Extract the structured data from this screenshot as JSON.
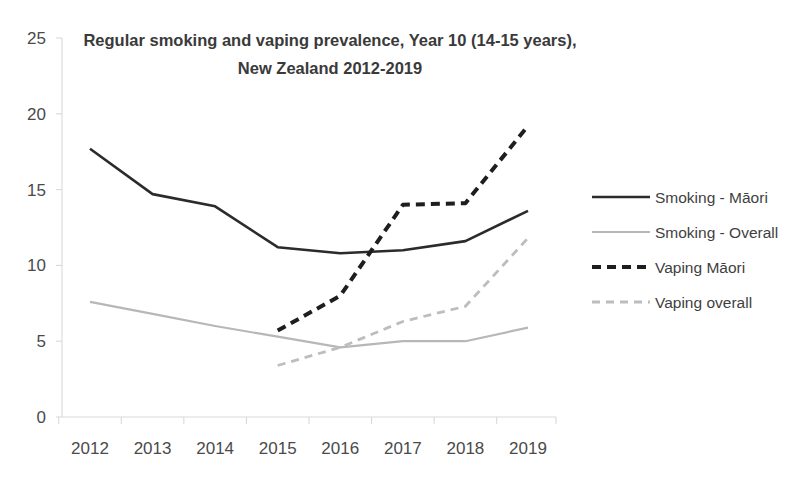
{
  "chart_data": {
    "type": "line",
    "title": "Regular smoking and vaping prevalence, Year 10 (14-15 years), New Zealand 2012-2019",
    "title_line1": "Regular smoking and vaping prevalence, Year 10 (14-15 years),",
    "title_line2": "New Zealand 2012-2019",
    "xlabel": "",
    "ylabel": "",
    "x": [
      2012,
      2013,
      2014,
      2015,
      2016,
      2017,
      2018,
      2019
    ],
    "categories": [
      "2012",
      "2013",
      "2014",
      "2015",
      "2016",
      "2017",
      "2018",
      "2019"
    ],
    "ylim": [
      0,
      25
    ],
    "yticks": [
      0,
      5,
      10,
      15,
      20,
      25
    ],
    "ytick_labels": [
      "0",
      "5",
      "10",
      "15",
      "20",
      "25"
    ],
    "grid": false,
    "legend_position": "right",
    "series": [
      {
        "name": "Smoking - Māori",
        "style": "solid",
        "color": "#2b2b2b",
        "width": 2.6,
        "values": [
          17.7,
          14.7,
          13.9,
          11.2,
          10.8,
          11.0,
          11.6,
          13.6
        ]
      },
      {
        "name": "Smoking - Overall",
        "style": "solid",
        "color": "#b7b7b7",
        "width": 2.2,
        "values": [
          7.6,
          6.8,
          6.0,
          5.3,
          4.6,
          5.0,
          5.0,
          5.9
        ]
      },
      {
        "name": "Vaping Māori",
        "style": "dashed",
        "color": "#1e1e1e",
        "width": 4.0,
        "dash": "9,6",
        "values": [
          null,
          null,
          null,
          5.7,
          8.0,
          14.0,
          14.1,
          19.2
        ]
      },
      {
        "name": "Vaping overall",
        "style": "dashed",
        "color": "#bdbdbd",
        "width": 2.8,
        "dash": "8,6",
        "values": [
          null,
          null,
          null,
          3.4,
          4.6,
          6.3,
          7.3,
          11.8
        ]
      }
    ]
  },
  "legend": {
    "items": [
      {
        "label": "Smoking - Māori",
        "swatch": "solid-dark-line-swatch"
      },
      {
        "label": "Smoking - Overall",
        "swatch": "solid-light-line-swatch"
      },
      {
        "label": "Vaping Māori",
        "swatch": "dashed-dark-line-swatch"
      },
      {
        "label": "Vaping overall",
        "swatch": "dashed-light-line-swatch"
      }
    ]
  },
  "colors": {
    "smoking_maori": "#2b2b2b",
    "smoking_overall": "#b7b7b7",
    "vaping_maori": "#1e1e1e",
    "vaping_overall": "#bdbdbd",
    "axis": "#d9d9d9",
    "text": "#3b3b3b",
    "background": "#ffffff"
  }
}
